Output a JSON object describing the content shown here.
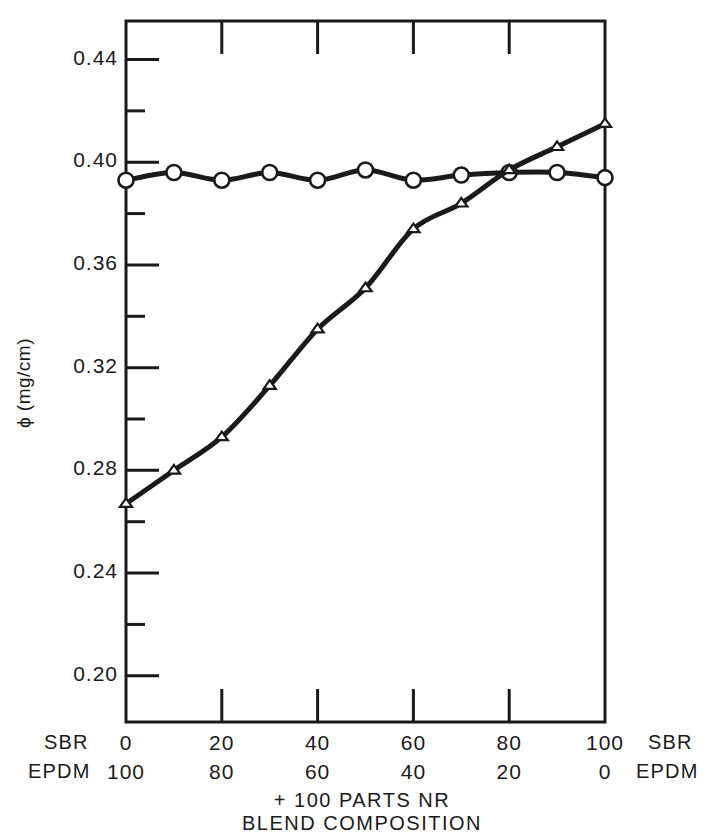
{
  "chart_data": {
    "type": "line",
    "title": "",
    "subtitle": "",
    "xlabel_lines": [
      "+ 100 PARTS NR",
      "BLEND COMPOSITION"
    ],
    "ylabel": "ϕ (mg/cm)",
    "xlim": [
      0,
      100
    ],
    "ylim": [
      0.182,
      0.455
    ],
    "grid": false,
    "legend": "none",
    "x_axis": {
      "primary_name": "SBR",
      "secondary_name": "EPDM",
      "primary_ticks": [
        "0",
        "20",
        "40",
        "60",
        "80",
        "100"
      ],
      "secondary_ticks": [
        "100",
        "80",
        "60",
        "40",
        "20",
        "0"
      ],
      "tick_positions": [
        0,
        20,
        40,
        60,
        80,
        100
      ],
      "minor_tick_positions": [
        10,
        30,
        50,
        70,
        90
      ]
    },
    "y_axis": {
      "tick_labels": [
        "0.44",
        "0.40",
        "0.36",
        "0.32",
        "0.28",
        "0.24",
        "0.20"
      ],
      "tick_values": [
        0.44,
        0.4,
        0.36,
        0.32,
        0.28,
        0.24,
        0.2
      ],
      "minor_tick_values": [
        0.42,
        0.38,
        0.34,
        0.3,
        0.26,
        0.22,
        0.46,
        0.18
      ]
    },
    "series": [
      {
        "name": "circles",
        "marker": "open-circle",
        "x": [
          0,
          10,
          20,
          30,
          40,
          50,
          60,
          70,
          80,
          90,
          100
        ],
        "values": [
          0.393,
          0.396,
          0.393,
          0.396,
          0.393,
          0.397,
          0.393,
          0.395,
          0.396,
          0.396,
          0.394
        ]
      },
      {
        "name": "triangles",
        "marker": "open-triangle",
        "x": [
          0,
          10,
          20,
          30,
          40,
          50,
          60,
          70,
          80,
          90,
          100
        ],
        "values": [
          0.267,
          0.28,
          0.293,
          0.313,
          0.335,
          0.351,
          0.374,
          0.384,
          0.397,
          0.406,
          0.415
        ]
      }
    ]
  },
  "axis_labels": {
    "left_primary": "SBR",
    "left_secondary": "EPDM",
    "right_primary": "SBR",
    "right_secondary": "EPDM"
  },
  "colors": {
    "ink": "#1a1a1a",
    "background": "#ffffff"
  }
}
